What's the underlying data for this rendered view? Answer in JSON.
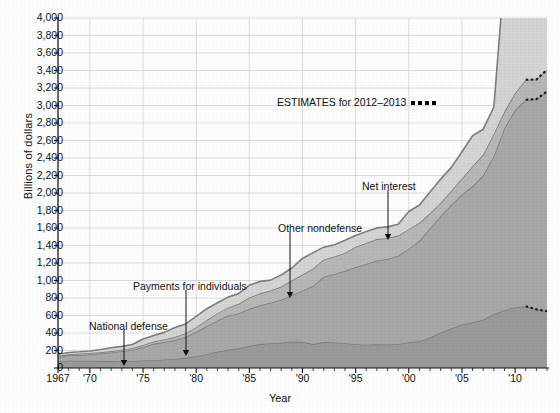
{
  "chart_data": {
    "type": "area",
    "title": "",
    "xlabel": "Year",
    "ylabel": "Billions of dollars",
    "xlim": [
      1967,
      2013
    ],
    "ylim": [
      0,
      4000
    ],
    "grid": true,
    "legend_position": "inline-annotations",
    "ytick_labels": [
      "4,000",
      "3,800",
      "3,600",
      "3,400",
      "3,200",
      "3,000",
      "2,800",
      "2,600",
      "2,400",
      "2,200",
      "2,000",
      "1,800",
      "1,600",
      "1,400",
      "1,200",
      "1,000",
      "800",
      "600",
      "400",
      "200",
      "0"
    ],
    "ytick_values": [
      4000,
      3800,
      3600,
      3400,
      3200,
      3000,
      2800,
      2600,
      2400,
      2200,
      2000,
      1800,
      1600,
      1400,
      1200,
      1000,
      800,
      600,
      400,
      200,
      0
    ],
    "xtick_labels": [
      "1967",
      "'70",
      "'75",
      "'80",
      "'85",
      "'90",
      "'95",
      "'00",
      "'05",
      "'10"
    ],
    "xtick_values": [
      1967,
      1970,
      1975,
      1980,
      1985,
      1990,
      1995,
      2000,
      2005,
      2010
    ],
    "x": [
      1967,
      1968,
      1969,
      1970,
      1971,
      1972,
      1973,
      1974,
      1975,
      1976,
      1977,
      1978,
      1979,
      1980,
      1981,
      1982,
      1983,
      1984,
      1985,
      1986,
      1987,
      1988,
      1989,
      1990,
      1991,
      1992,
      1993,
      1994,
      1995,
      1996,
      1997,
      1998,
      1999,
      2000,
      2001,
      2002,
      2003,
      2004,
      2005,
      2006,
      2007,
      2008,
      2009,
      2010,
      2011,
      2012,
      2013
    ],
    "estimate_start_year": 2012,
    "estimate_note": "ESTIMATES for 2012–2013",
    "series": [
      {
        "name": "National defense",
        "color": "#9a9a9a",
        "values": [
          71,
          82,
          82,
          82,
          79,
          79,
          77,
          80,
          87,
          90,
          97,
          104,
          116,
          134,
          158,
          185,
          210,
          227,
          253,
          273,
          282,
          290,
          304,
          299,
          273,
          298,
          291,
          282,
          272,
          266,
          271,
          268,
          275,
          295,
          306,
          349,
          405,
          455,
          495,
          522,
          551,
          616,
          661,
          694,
          706,
          670,
          650
        ]
      },
      {
        "name": "Payments for individuals",
        "color": "#a8a8a8",
        "values": [
          55,
          63,
          68,
          75,
          87,
          99,
          114,
          127,
          154,
          186,
          200,
          215,
          238,
          280,
          322,
          357,
          390,
          396,
          423,
          444,
          465,
          490,
          529,
          585,
          668,
          744,
          784,
          830,
          882,
          922,
          958,
          977,
          1008,
          1069,
          1147,
          1248,
          1330,
          1411,
          1486,
          1557,
          1651,
          1808,
          2083,
          2254,
          2359,
          2403,
          2510
        ]
      },
      {
        "name": "Net interest",
        "color": "#b7b7b7",
        "values": [
          10,
          11,
          13,
          14,
          15,
          15,
          17,
          21,
          23,
          27,
          30,
          35,
          43,
          53,
          69,
          85,
          90,
          111,
          130,
          136,
          139,
          152,
          169,
          184,
          195,
          199,
          199,
          203,
          232,
          241,
          244,
          242,
          230,
          223,
          206,
          171,
          153,
          160,
          184,
          227,
          237,
          253,
          187,
          196,
          230,
          225,
          248
        ]
      },
      {
        "name": "Other nondefense",
        "color": "#d4d4d4",
        "values": [
          21,
          22,
          22,
          24,
          30,
          38,
          39,
          41,
          68,
          68,
          80,
          109,
          107,
          124,
          129,
          118,
          120,
          118,
          140,
          137,
          118,
          132,
          141,
          185,
          183,
          140,
          134,
          144,
          129,
          131,
          128,
          126,
          130,
          202,
          204,
          243,
          271,
          267,
          307,
          349,
          290,
          306,
          1587,
          1313,
          1308,
          1231,
          1395
        ]
      }
    ],
    "annotations": [
      {
        "label": "National defense",
        "text_x": 89,
        "text_y": 320,
        "arrow_x": 124,
        "arrow_y0": 330,
        "arrow_y1": 366
      },
      {
        "label": "Payments for individuals",
        "text_x": 133,
        "text_y": 280,
        "arrow_x": 186,
        "arrow_y0": 290,
        "arrow_y1": 356
      },
      {
        "label": "Other nondefense",
        "text_x": 278,
        "text_y": 222,
        "arrow_x": 290,
        "arrow_y0": 232,
        "arrow_y1": 298
      },
      {
        "label": "Net interest",
        "text_x": 362,
        "text_y": 180,
        "arrow_x": 388,
        "arrow_y0": 190,
        "arrow_y1": 240
      }
    ]
  }
}
